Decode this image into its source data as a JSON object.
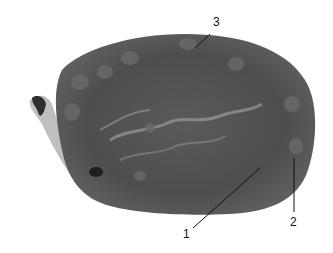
{
  "figure": {
    "labels": [
      {
        "id": "1",
        "text": "1",
        "x": 186,
        "y": 232
      },
      {
        "id": "2",
        "text": "2",
        "x": 290,
        "y": 218
      },
      {
        "id": "3",
        "text": "3",
        "x": 213,
        "y": 17
      }
    ],
    "colors": {
      "background": "#ffffff",
      "tissue_dark": "#4a4a4a",
      "tissue_mid": "#6e6e6e",
      "tissue_light": "#9a9a9a",
      "label": "#111111"
    }
  }
}
